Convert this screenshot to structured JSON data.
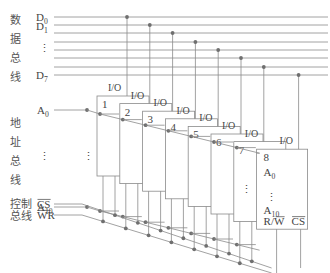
{
  "figure": {
    "colors": {
      "line": "#8a8a8a",
      "dot": "#6f6f6f",
      "text": "#444444"
    }
  },
  "buses": {
    "data": {
      "label_chars": [
        "数",
        "据",
        "总",
        "线"
      ],
      "lines": [
        {
          "label": "D",
          "sub": "0"
        },
        {
          "label": "D",
          "sub": "1"
        },
        {
          "label": "",
          "sub": ""
        },
        {
          "label": "",
          "sub": ""
        },
        {
          "label": "",
          "sub": ""
        },
        {
          "label": "",
          "sub": ""
        },
        {
          "label": "",
          "sub": ""
        },
        {
          "label": "D",
          "sub": "7"
        }
      ],
      "ellipsis": "⋮"
    },
    "address": {
      "label_chars": [
        "地",
        "址",
        "总",
        "线"
      ],
      "top": {
        "label": "A",
        "sub": "0"
      },
      "bottom": {
        "label": "A",
        "sub": "10"
      },
      "ellipsis": "⋮"
    },
    "control": {
      "label_lines": [
        "控制",
        "总线"
      ],
      "signals": [
        {
          "label": "CS",
          "overline": true
        },
        {
          "label": "WR",
          "overline": true
        }
      ]
    }
  },
  "chips": [
    {
      "number": "1",
      "io_label": "I/O"
    },
    {
      "number": "2",
      "io_label": "I/O"
    },
    {
      "number": "3",
      "io_label": "I/O"
    },
    {
      "number": "4",
      "io_label": "I/O"
    },
    {
      "number": "5",
      "io_label": "I/O"
    },
    {
      "number": "6",
      "io_label": "I/O"
    },
    {
      "number": "7",
      "io_label": "I/O"
    },
    {
      "number": "8",
      "io_label": "I/O"
    }
  ],
  "front_chip_pins": {
    "a0": {
      "label": "A",
      "sub": "0"
    },
    "ellipsis": "⋮",
    "a10": {
      "label": "A",
      "sub": "10"
    },
    "rw": {
      "label": "R/",
      "bar": "W"
    },
    "cs": {
      "label": "CS",
      "overline": true
    }
  }
}
